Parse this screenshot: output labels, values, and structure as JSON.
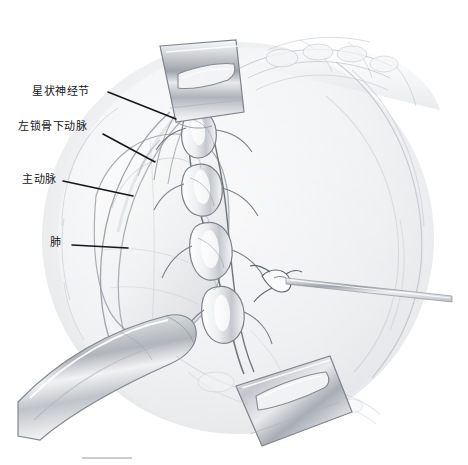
{
  "figure": {
    "kind": "surgical-anatomy-illustration",
    "style": "graphite pencil medical illustration",
    "background_color": "#ffffff",
    "ink_color": "#15161a",
    "tissue_gray": "#c9ccd1",
    "metal_gray": "#b4b8be",
    "width": 468,
    "height": 465
  },
  "labels": [
    {
      "id": "stellate-ganglion",
      "text": "星状神经节",
      "leader": {
        "x1": 108,
        "y1": 92,
        "x2": 176,
        "y2": 119
      }
    },
    {
      "id": "left-subclavian-artery",
      "text": "左锁骨下动脉",
      "leader": {
        "x1": 103,
        "y1": 134,
        "x2": 155,
        "y2": 162
      }
    },
    {
      "id": "aorta",
      "text": "主动脉",
      "leader": {
        "x1": 63,
        "y1": 181,
        "x2": 133,
        "y2": 196
      }
    },
    {
      "id": "lung",
      "text": "肺",
      "leader": {
        "x1": 72,
        "y1": 245,
        "x2": 128,
        "y2": 248
      }
    }
  ],
  "instruments": [
    {
      "id": "retractor-blade-upper",
      "description": "metal retractor blade with oval fenestration, upper center"
    },
    {
      "id": "retractor-blade-lower-right",
      "description": "metal retractor blade with oval fenestration, lower right"
    },
    {
      "id": "retractor-blade-lower-left",
      "description": "broad curved metal retractor blade, lower left"
    },
    {
      "id": "nerve-probe",
      "description": "slender straight probe entering from right toward suture knot"
    },
    {
      "id": "suture-knot",
      "description": "tied suture loop on sympathetic chain"
    }
  ],
  "structures": [
    {
      "id": "sympathetic-chain",
      "description": "vertical chain of ganglia with connecting rami, center"
    },
    {
      "id": "ribs",
      "description": "rib shadows arcing across upper right and lower right"
    },
    {
      "id": "lung-lobe",
      "description": "soft rounded lung surface, left of center"
    },
    {
      "id": "aortic-arch",
      "description": "large vessel sweeping down the left field"
    },
    {
      "id": "scale-bar",
      "description": "faint horizontal rule near lower left"
    }
  ]
}
